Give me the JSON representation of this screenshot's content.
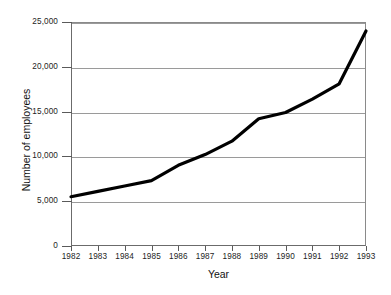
{
  "chart_data": {
    "type": "line",
    "title": "",
    "xlabel": "Year",
    "ylabel": "Number of employees",
    "categories": [
      "1982",
      "1983",
      "1984",
      "1985",
      "1986",
      "1987",
      "1988",
      "1989",
      "1990",
      "1991",
      "1992",
      "1993"
    ],
    "x": [
      1982,
      1983,
      1984,
      1985,
      1986,
      1987,
      1988,
      1989,
      1990,
      1991,
      1992,
      1993
    ],
    "values": [
      5500,
      6100,
      6700,
      7300,
      9000,
      10200,
      11700,
      14200,
      14900,
      16400,
      18100,
      24000
    ],
    "series": [
      {
        "name": "Number of employees",
        "values": [
          5500,
          6100,
          6700,
          7300,
          9000,
          10200,
          11700,
          14200,
          14900,
          16400,
          18100,
          24000
        ]
      }
    ],
    "ylim": [
      0,
      25000
    ],
    "xlim": [
      1982,
      1993
    ],
    "yticks": [
      0,
      5000,
      10000,
      15000,
      20000,
      25000
    ],
    "ytick_labels": [
      "0",
      "5,000",
      "10,000",
      "15,000",
      "20,000",
      "25,000"
    ],
    "xtick_labels": [
      "1982",
      "1983",
      "1984",
      "1985",
      "1986",
      "1987",
      "1988",
      "1989",
      "1990",
      "1991",
      "1992",
      "1993"
    ],
    "grid": true,
    "grid_axis": "y",
    "legend": false,
    "legend_position": "none",
    "line_color": "#000000",
    "line_width": 3,
    "grid_color": "#9a9a9a",
    "axis_color": "#6b6b6b",
    "background_color": "#ffffff",
    "text_color": "#1d1d1d"
  }
}
